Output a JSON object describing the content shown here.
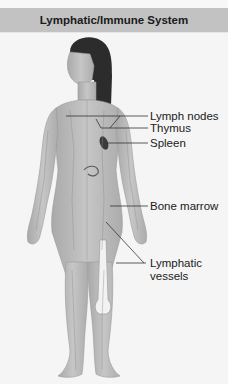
{
  "figure": {
    "title": "Lymphatic/Immune System",
    "labels": {
      "lymph_nodes": "Lymph nodes",
      "thymus": "Thymus",
      "spleen": "Spleen",
      "bone_marrow": "Bone marrow",
      "lymphatic_vessels_line1": "Lymphatic",
      "lymphatic_vessels_line2": "vessels"
    },
    "illustration": "anterior-view-female-figure-with-lymphatic-system",
    "colors": {
      "title_bar": "#c2c2c2",
      "background": "#f5f5f5",
      "body_tone": "#bdbdbd",
      "hair": "#2a2a2a",
      "leader_line": "#333333"
    }
  }
}
